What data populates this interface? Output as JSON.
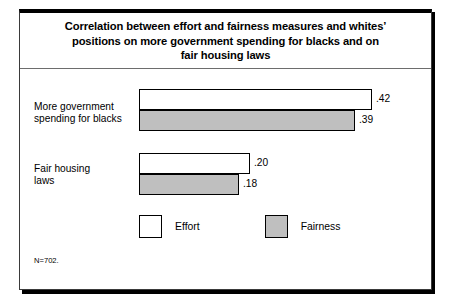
{
  "chart_data": {
    "type": "bar",
    "orientation": "horizontal",
    "title": "Correlation between effort and fairness measures and whites’ positions on more government spending for blacks and on fair housing laws",
    "title_lines": [
      "Correlation between effort and fairness measures and whites’",
      "positions on more government spending for blacks and on",
      "fair housing laws"
    ],
    "categories": [
      "More government spending for blacks",
      "Fair housing laws"
    ],
    "category_lines": [
      [
        "More government",
        "spending for blacks"
      ],
      [
        "Fair housing",
        "laws"
      ]
    ],
    "series": [
      {
        "name": "Effort",
        "values": [
          0.42,
          0.2
        ],
        "labels": [
          ".42",
          ".20"
        ],
        "color": "#ffffff"
      },
      {
        "name": "Fairness",
        "values": [
          0.39,
          0.18
        ],
        "labels": [
          ".39",
          ".18"
        ],
        "color": "#bfbfbf"
      }
    ],
    "xlabel": "",
    "ylabel": "",
    "xlim": [
      0,
      0.45
    ],
    "grid": false,
    "legend_position": "bottom",
    "footnote": "N=702."
  },
  "legend": {
    "items": [
      {
        "label": "Effort"
      },
      {
        "label": "Fairness"
      }
    ]
  },
  "footnote": "N=702."
}
